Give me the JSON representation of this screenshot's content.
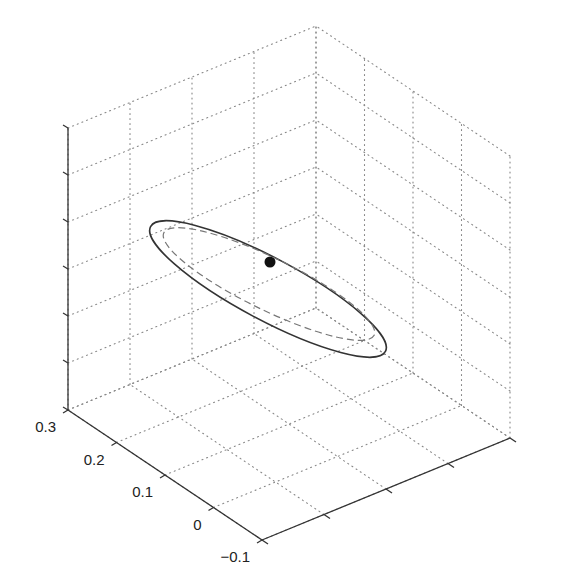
{
  "chart_data": {
    "type": "scatter",
    "title": "",
    "xlabel": "",
    "ylabel": "",
    "zlabel": "",
    "xlim": [
      0.1,
      0.5
    ],
    "ylim": [
      -0.1,
      0.3
    ],
    "zlim": [
      0.88,
      1.0
    ],
    "x_ticks": [
      "0.1",
      "0.2",
      "0.3",
      "0.4",
      "0.5"
    ],
    "y_ticks": [
      "-0.1",
      "0",
      "0.1",
      "0.2",
      "0.3"
    ],
    "z_ticks": [
      "0.88",
      "0.9",
      "0.92",
      "0.94",
      "0.96",
      "0.98",
      "1"
    ],
    "grid": true,
    "grid_style": "dotted",
    "legend": null,
    "series": [
      {
        "name": "point",
        "kind": "marker",
        "marker": "filled-circle",
        "color": "#111111",
        "screen_center": [
          270,
          262
        ],
        "approx_z": 0.94
      },
      {
        "name": "ellipse-solid",
        "kind": "ellipse",
        "line_style": "solid",
        "color": "#333333",
        "screen_center": [
          268,
          289
        ],
        "screen_rx": 133,
        "screen_ry": 31,
        "rotation_deg": 28
      },
      {
        "name": "ellipse-dashed",
        "kind": "ellipse",
        "line_style": "dashed",
        "color": "#777777",
        "screen_center": [
          269,
          284
        ],
        "screen_rx": 117,
        "screen_ry": 26,
        "rotation_deg": 26
      }
    ]
  },
  "colors": {
    "axis": "#333333",
    "grid": "#888888",
    "text": "#222222"
  }
}
